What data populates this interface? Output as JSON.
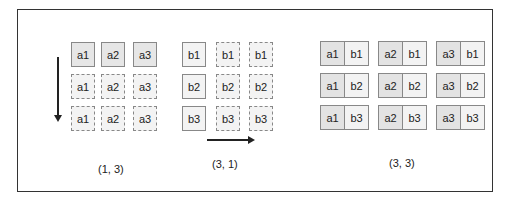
{
  "diagram": {
    "panel_a": {
      "caption": "(1, 3)",
      "rows": [
        [
          "a1",
          "a2",
          "a3"
        ],
        [
          "a1",
          "a2",
          "a3"
        ],
        [
          "a1",
          "a2",
          "a3"
        ]
      ]
    },
    "panel_b": {
      "caption": "(3, 1)",
      "rows": [
        [
          "b1",
          "b1",
          "b1"
        ],
        [
          "b2",
          "b2",
          "b2"
        ],
        [
          "b3",
          "b3",
          "b3"
        ]
      ]
    },
    "panel_c": {
      "caption": "(3, 3)",
      "rows": [
        [
          [
            "a1",
            "b1"
          ],
          [
            "a2",
            "b1"
          ],
          [
            "a3",
            "b1"
          ]
        ],
        [
          [
            "a1",
            "b2"
          ],
          [
            "a2",
            "b2"
          ],
          [
            "a3",
            "b2"
          ]
        ],
        [
          [
            "a1",
            "b3"
          ],
          [
            "a2",
            "b3"
          ],
          [
            "a3",
            "b3"
          ]
        ]
      ]
    },
    "arrows": {
      "vertical": "down-arrow",
      "horizontal": "right-arrow"
    },
    "colors": {
      "border": "#888888",
      "dark_fill": "#e6e6e6",
      "light_fill": "#f3f3f3",
      "frame": "#333333"
    }
  }
}
